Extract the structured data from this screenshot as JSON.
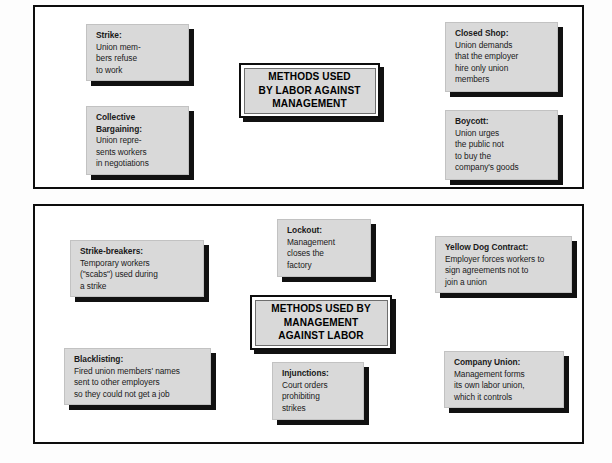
{
  "diagram": {
    "panels": [
      {
        "id": "labor",
        "hub_title": [
          "METHODS USED",
          "BY LABOR AGAINST",
          "MANAGEMENT"
        ],
        "nodes": [
          {
            "id": "strike",
            "title": "Strike:",
            "lines": [
              "Union mem-",
              "bers refuse",
              "to work"
            ]
          },
          {
            "id": "collective-bargaining",
            "title": "Collective",
            "title2": "Bargaining:",
            "lines": [
              "Union repre-",
              "sents workers",
              "in negotiations"
            ]
          },
          {
            "id": "closed-shop",
            "title": "Closed Shop:",
            "lines": [
              "Union demands",
              "that the employer",
              "hire only union",
              "members"
            ]
          },
          {
            "id": "boycott",
            "title": "Boycott:",
            "lines": [
              "Union urges",
              "the public not",
              "to buy the",
              "company's goods"
            ]
          }
        ]
      },
      {
        "id": "management",
        "hub_title": [
          "METHODS USED BY",
          "MANAGEMENT",
          "AGAINST LABOR"
        ],
        "nodes": [
          {
            "id": "lockout",
            "title": "Lockout:",
            "lines": [
              "Management",
              "closes the",
              "factory"
            ]
          },
          {
            "id": "strike-breakers",
            "title": "Strike-breakers:",
            "lines": [
              "Temporary workers",
              "(\"scabs\") used during",
              "a  strike"
            ]
          },
          {
            "id": "yellow-dog-contract",
            "title": "Yellow Dog Contract:",
            "lines": [
              "Employer forces workers to",
              "sign agreements not to",
              "join a union"
            ]
          },
          {
            "id": "blacklisting",
            "title": "Blacklisting:",
            "lines": [
              "Fired union members' names",
              "sent to other employers",
              "so they could not get a job"
            ]
          },
          {
            "id": "injunctions",
            "title": "Injunctions:",
            "lines": [
              "Court orders",
              "prohibiting",
              "strikes"
            ]
          },
          {
            "id": "company-union",
            "title": "Company Union:",
            "lines": [
              "Management forms",
              "its own labor union,",
              "which it controls"
            ]
          }
        ]
      }
    ],
    "colors": {
      "node_fill": "#d9d9d9",
      "node_shadow": "#111111",
      "frame": "#0d0d0d",
      "connector": "#d4d4d4",
      "page_background": "#ffffff"
    }
  }
}
